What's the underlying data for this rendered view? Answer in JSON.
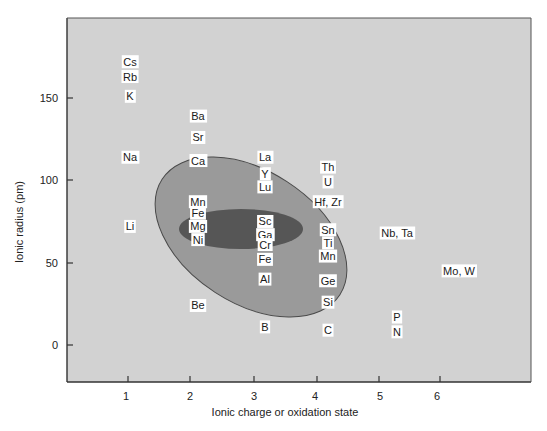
{
  "chart_data": {
    "type": "scatter",
    "title": "",
    "xlabel": "Ionic charge or oxidation state",
    "ylabel": "Ionic radius (pm)",
    "xlim": [
      0.1,
      7.3
    ],
    "ylim": [
      -22,
      198
    ],
    "x_ticks": [
      1,
      2,
      3,
      4,
      5,
      6
    ],
    "y_ticks": [
      0,
      50,
      100,
      150
    ],
    "grid": false,
    "legend": null,
    "colors": {
      "plot_background": "#d2d2d2",
      "outer_ellipse": "#9a9a9a",
      "inner_ellipse": "#565656",
      "label_box": "#ffffff",
      "frame": "#333333"
    },
    "regions": [
      {
        "name": "outer-ellipse",
        "center": [
          3.05,
          64
        ],
        "note": "tilted ellipse covering charge ~1.3-4.2"
      },
      {
        "name": "inner-ellipse",
        "center": [
          2.6,
          70
        ],
        "note": "dark core region charge ~1.7-3.6"
      }
    ],
    "points": [
      {
        "label": "Cs",
        "x": 1,
        "y": 172
      },
      {
        "label": "Rb",
        "x": 1,
        "y": 163
      },
      {
        "label": "K",
        "x": 1,
        "y": 151
      },
      {
        "label": "Na",
        "x": 1,
        "y": 114
      },
      {
        "label": "Li",
        "x": 1,
        "y": 72
      },
      {
        "label": "Ba",
        "x": 2,
        "y": 139
      },
      {
        "label": "Sr",
        "x": 2,
        "y": 126
      },
      {
        "label": "Ca",
        "x": 2,
        "y": 112
      },
      {
        "label": "Mn",
        "x": 2,
        "y": 87
      },
      {
        "label": "Fe",
        "x": 2,
        "y": 80
      },
      {
        "label": "Mg",
        "x": 2,
        "y": 72
      },
      {
        "label": "Ni",
        "x": 2,
        "y": 64
      },
      {
        "label": "Be",
        "x": 2,
        "y": 24
      },
      {
        "label": "La",
        "x": 3,
        "y": 114
      },
      {
        "label": "Y",
        "x": 3,
        "y": 104
      },
      {
        "label": "Lu",
        "x": 3,
        "y": 96
      },
      {
        "label": "Sc",
        "x": 3,
        "y": 75
      },
      {
        "label": "Ga",
        "x": 3,
        "y": 67
      },
      {
        "label": "Cr",
        "x": 3,
        "y": 61
      },
      {
        "label": "Fe",
        "x": 3,
        "y": 52
      },
      {
        "label": "Al",
        "x": 3,
        "y": 40
      },
      {
        "label": "B",
        "x": 3,
        "y": 11
      },
      {
        "label": "Th",
        "x": 4,
        "y": 108
      },
      {
        "label": "U",
        "x": 4,
        "y": 99
      },
      {
        "label": "Hf, Zr",
        "x": 4,
        "y": 87
      },
      {
        "label": "Sn",
        "x": 4,
        "y": 70
      },
      {
        "label": "Ti",
        "x": 4,
        "y": 62
      },
      {
        "label": "Mn",
        "x": 4,
        "y": 54
      },
      {
        "label": "Ge",
        "x": 4,
        "y": 39
      },
      {
        "label": "Si",
        "x": 4,
        "y": 26
      },
      {
        "label": "C",
        "x": 4,
        "y": 9
      },
      {
        "label": "Nb, Ta",
        "x": 5,
        "y": 68
      },
      {
        "label": "P",
        "x": 5,
        "y": 17
      },
      {
        "label": "N",
        "x": 5,
        "y": 8
      },
      {
        "label": "Mo, W",
        "x": 6,
        "y": 45
      }
    ]
  }
}
